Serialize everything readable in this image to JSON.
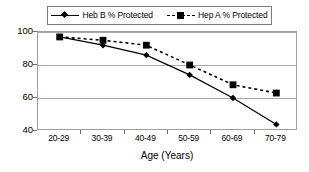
{
  "chart_data": {
    "type": "line",
    "title": "",
    "subtitle": "",
    "xlabel": "Age (Years)",
    "ylabel": "",
    "categories": [
      "20-29",
      "30-39",
      "40-49",
      "50-59",
      "60-69",
      "70-79"
    ],
    "series": [
      {
        "name": "Heb B % Protected",
        "values": [
          97,
          92,
          86,
          74,
          60,
          44
        ],
        "marker": "diamond",
        "line_style": "solid",
        "color": "#000000"
      },
      {
        "name": "Hep A % Protected",
        "values": [
          97,
          95,
          92,
          80,
          68,
          63
        ],
        "marker": "square",
        "line_style": "dashed",
        "color": "#000000"
      }
    ],
    "ylim": [
      40,
      100
    ],
    "yticks": [
      40,
      60,
      80,
      100
    ],
    "ytick_labels": [
      "40",
      "60",
      "80",
      "100"
    ],
    "grid": "horizontal",
    "legend_position": "top-center",
    "axis_color": "#a0a0a0",
    "gridline_color": "#a8a8a8"
  },
  "legend": {
    "entries": [
      {
        "label": "Heb B % Protected"
      },
      {
        "label": "Hep A % Protected"
      }
    ]
  },
  "axes": {
    "x_title": "Age (Years)",
    "y_tick_labels": [
      "100",
      "80",
      "60",
      "40"
    ],
    "x_tick_labels": [
      "20-29",
      "30-39",
      "40-49",
      "50-59",
      "60-69",
      "70-79"
    ]
  }
}
